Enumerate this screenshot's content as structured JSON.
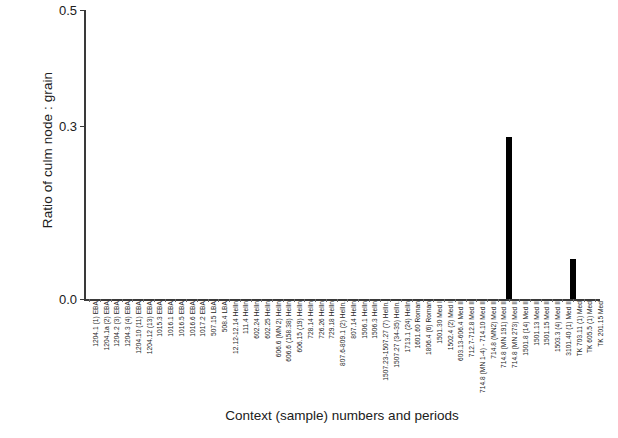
{
  "chart_data": {
    "type": "bar",
    "title": "",
    "subtitle": "",
    "xlabel": "Context (sample) numbers and periods",
    "ylabel": "Ratio of culm node : grain",
    "ylim": [
      0.0,
      0.5
    ],
    "yticks": [
      0.0,
      0.3,
      0.5
    ],
    "ytick_labels": [
      "0.0",
      "0.3",
      "0.5"
    ],
    "grid": false,
    "legend": "none",
    "bar_color": "#000000",
    "axis_color": "#3a3a3a",
    "categories": [
      "1204.1 (1) EBA",
      "1204.1a (2) EBA",
      "1204.2 (3) EBA",
      "1204.3 (4) EBA",
      "1204.10 (11) EBA",
      "1204.12 (13) EBA",
      "1015.3 EBA",
      "1016.1 EBA",
      "1016.5 EBA",
      "1016.6 EBA",
      "1017.2 EBA",
      "507.15 LBA",
      "508.4 LBA",
      "12.12-12.14 Helln",
      "111.4 Helln",
      "602.24 Helln",
      "602.25 Helln",
      "606.6 (MN 2) Helln",
      "606.6 (158.38) Helln",
      "606.15 (19) Helln",
      "728.14 Helln",
      "726.26 Helln",
      "729.18 Helln",
      "807.6-809.1 (2) Helln.",
      "807.14 Helln",
      "1506.1 Helln",
      "1506.3 Helln",
      "1507.23-1507.27 (7) Helln.",
      "1507.27 (34-35) Helln.",
      "1713.1 (24) Helln",
      "1601.60 Roman",
      "1806.4 (6) Roman",
      "1501.30 Med I",
      "1502.4 (2) Med I",
      "603.13-606.4 Med II",
      "712.7-712.8 Med II",
      "714.8 (MN 1-4) - 714.10 Med II",
      "714.8 (MN2) Med II",
      "714.8 (MN 191) Med II",
      "714.8 (MN 273) Med II",
      "1501.8 (14) Med II",
      "1501.13 Med II",
      "1501.15 Med II",
      "1503.3 (4) Med II",
      "3101.40 (1) Med II",
      "TK 703.11 (1) Med",
      "TK 605.5 (1) Med",
      "TK 201.15 Med"
    ],
    "values": [
      0,
      0,
      0,
      0,
      0,
      0,
      0,
      0,
      0,
      0,
      0,
      0,
      0,
      0,
      0,
      0,
      0,
      0,
      0,
      0,
      0,
      0,
      0,
      0,
      0,
      0,
      0,
      0,
      0,
      0,
      0,
      0,
      0,
      0,
      0,
      0,
      0,
      0,
      0,
      0.28,
      0,
      0,
      0,
      0,
      0,
      0.07,
      0,
      0
    ]
  }
}
